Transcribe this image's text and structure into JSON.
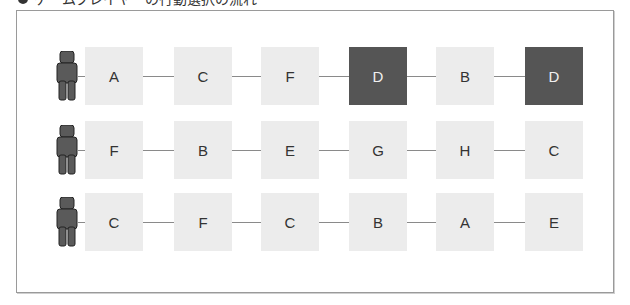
{
  "header": {
    "title_cut": "ゲームプレイヤーの行動選択の流れ"
  },
  "diagram": {
    "colors": {
      "light_box": "#ececec",
      "dark_box": "#555555",
      "person": "#5a5a5a",
      "line": "#8a8a8a"
    },
    "rows": [
      {
        "player": "player-1",
        "steps": [
          {
            "label": "A",
            "highlight": false
          },
          {
            "label": "C",
            "highlight": false
          },
          {
            "label": "F",
            "highlight": false
          },
          {
            "label": "D",
            "highlight": true
          },
          {
            "label": "B",
            "highlight": false
          },
          {
            "label": "D",
            "highlight": true
          }
        ]
      },
      {
        "player": "player-2",
        "steps": [
          {
            "label": "F",
            "highlight": false
          },
          {
            "label": "B",
            "highlight": false
          },
          {
            "label": "E",
            "highlight": false
          },
          {
            "label": "G",
            "highlight": false
          },
          {
            "label": "H",
            "highlight": false
          },
          {
            "label": "C",
            "highlight": false
          }
        ]
      },
      {
        "player": "player-3",
        "steps": [
          {
            "label": "C",
            "highlight": false
          },
          {
            "label": "F",
            "highlight": false
          },
          {
            "label": "C",
            "highlight": false
          },
          {
            "label": "B",
            "highlight": false
          },
          {
            "label": "A",
            "highlight": false
          },
          {
            "label": "E",
            "highlight": false
          }
        ]
      }
    ]
  }
}
